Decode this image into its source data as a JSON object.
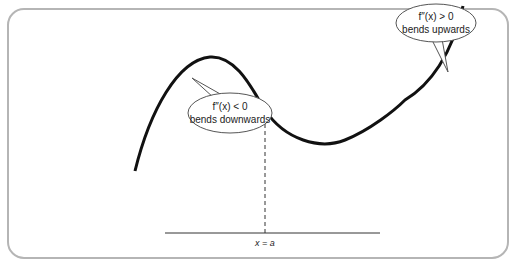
{
  "diagram": {
    "frame_color": "#b5b5b5",
    "curve_color": "#111111",
    "callouts": [
      {
        "id": "concave",
        "math": "f″(x) < 0",
        "text": "bends downwards"
      },
      {
        "id": "convex",
        "math": "f″(x) > 0",
        "text": "bends upwards"
      }
    ],
    "axis_label": "x = a"
  }
}
